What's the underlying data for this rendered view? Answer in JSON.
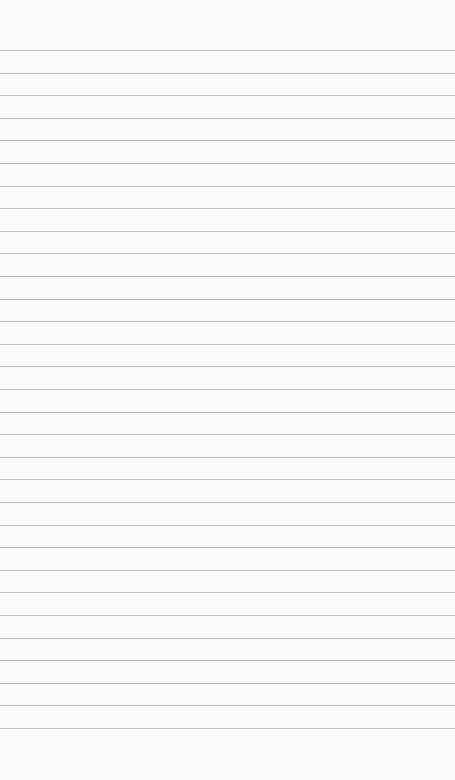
{
  "notepad": {
    "content": "",
    "placeholder": "",
    "background_color": "#fafafa",
    "line_color": "#bdbdbd",
    "line_count": 31,
    "first_line_y": 50,
    "line_spacing": 22.6
  }
}
